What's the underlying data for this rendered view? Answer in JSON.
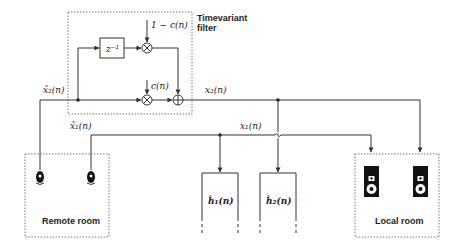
{
  "filter": {
    "title_line1": "Timevariant",
    "title_line2": "filter",
    "delay_label": "z⁻¹",
    "gain_top": "1 − c(n)",
    "gain_bottom": "c(n)"
  },
  "signals": {
    "x2_tilde": "x̃₂(n)",
    "x1_tilde": "x̃₁(n)",
    "x2": "x₂(n)",
    "x1": "x₁(n)"
  },
  "blocks": {
    "h1": "ĥ₁(n)",
    "h2": "ĥ₂(n)"
  },
  "rooms": {
    "remote": "Remote room",
    "local": "Local room"
  },
  "colors": {
    "line": "#333333",
    "text": "#222222",
    "background": "#ffffff"
  }
}
